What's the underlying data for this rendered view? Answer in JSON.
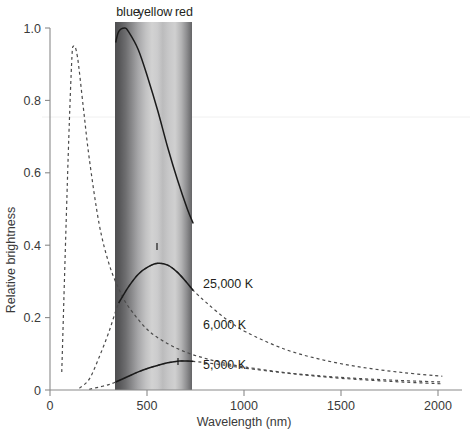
{
  "chart_data": {
    "type": "line",
    "title": "",
    "xlabel": "Wavelength (nm)",
    "ylabel": "Relative brightness",
    "xlim": [
      0,
      2100
    ],
    "ylim": [
      0,
      1.06
    ],
    "xticks": [
      0,
      500,
      1000,
      1500,
      2000
    ],
    "xtick_labels": [
      "0",
      "500",
      "1000",
      "1500",
      "2000"
    ],
    "yticks": [
      0,
      0.2,
      0.4,
      0.6,
      0.8,
      1.0
    ],
    "ytick_labels": [
      "0",
      "0.2",
      "0.4",
      "0.6",
      "0.8",
      "1.0"
    ],
    "grid": false,
    "legend_position": "inline-annotations",
    "visible_band": {
      "start_nm": 335,
      "end_nm": 730,
      "labels": [
        "blue",
        "yellow",
        "red"
      ],
      "label_positions_nm": [
        400,
        530,
        670
      ]
    },
    "series": [
      {
        "name": "25,000 K",
        "label": "25,000 K",
        "peak_nm": 120,
        "peak_value": 0.95,
        "style": "dashed",
        "x": [
          60,
          90,
          110,
          120,
          140,
          170,
          200,
          250,
          300,
          350,
          400,
          500,
          600,
          700,
          800,
          900,
          1000,
          1200,
          1400,
          1600,
          1800,
          2000
        ],
        "y": [
          0.05,
          0.6,
          0.9,
          0.95,
          0.92,
          0.78,
          0.64,
          0.46,
          0.35,
          0.28,
          0.23,
          0.165,
          0.128,
          0.103,
          0.086,
          0.073,
          0.063,
          0.048,
          0.038,
          0.031,
          0.026,
          0.022
        ]
      },
      {
        "name": "25,000 K visible",
        "label": "",
        "peak_nm": 380,
        "peak_value": 1.0,
        "style": "solid",
        "x": [
          335,
          350,
          380,
          400,
          450,
          500,
          550,
          600,
          650,
          700,
          730
        ],
        "y": [
          0.96,
          0.99,
          1.0,
          0.99,
          0.94,
          0.86,
          0.77,
          0.67,
          0.58,
          0.5,
          0.46
        ]
      },
      {
        "name": "6,000 K",
        "label": "6,000 K",
        "peak_nm": 550,
        "peak_value": 0.35,
        "style": "dashed",
        "x": [
          150,
          200,
          250,
          300,
          350,
          400,
          450,
          500,
          550,
          600,
          650,
          700,
          730,
          800,
          900,
          1000,
          1200,
          1400,
          1600,
          1800,
          2000
        ],
        "y": [
          0.005,
          0.03,
          0.09,
          0.16,
          0.24,
          0.285,
          0.32,
          0.34,
          0.35,
          0.345,
          0.325,
          0.295,
          0.275,
          0.24,
          0.195,
          0.16,
          0.112,
          0.082,
          0.062,
          0.048,
          0.038
        ]
      },
      {
        "name": "5,000 K",
        "label": "5,000 K",
        "peak_nm": 660,
        "peak_value": 0.08,
        "style": "dashed",
        "x": [
          200,
          250,
          300,
          335,
          400,
          450,
          500,
          550,
          600,
          660,
          700,
          730,
          800,
          900,
          1000,
          1200,
          1400,
          1600,
          1800,
          2000
        ],
        "y": [
          0.002,
          0.008,
          0.015,
          0.022,
          0.038,
          0.05,
          0.06,
          0.068,
          0.075,
          0.08,
          0.08,
          0.079,
          0.075,
          0.068,
          0.06,
          0.047,
          0.036,
          0.028,
          0.022,
          0.017
        ]
      }
    ]
  },
  "axes": {
    "y_axis_label": "Relative brightness",
    "x_axis_label": "Wavelength (nm)"
  },
  "annotations": {
    "band_blue": "blue",
    "band_yellow": "yellow",
    "band_red": "red",
    "curve_25000": "25,000 K",
    "curve_6000": "6,000 K",
    "curve_5000": "5,000 K"
  },
  "colors": {
    "axis": "#8a8a8a",
    "solid_curve": "#1a1a1a",
    "dashed_curve": "#4a4a4a",
    "text": "#231f20",
    "band_dark": "#58585a",
    "band_light": "#d2d2d2"
  }
}
